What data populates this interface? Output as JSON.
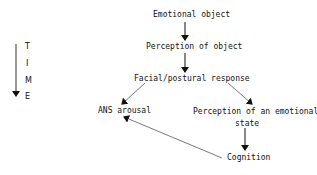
{
  "diagram": {
    "time_axis": {
      "letters": [
        "T",
        "I",
        "M",
        "E"
      ]
    },
    "nodes": [
      {
        "id": "emotional-object",
        "label": "Emotional object"
      },
      {
        "id": "perception-of-object",
        "label": "Perception of object"
      },
      {
        "id": "facial-postural-response",
        "label": "Facial/postural response"
      },
      {
        "id": "ans-arousal",
        "label": "ANS arousal"
      },
      {
        "id": "perception-emotional-state-1",
        "label": "Perception of an emotional"
      },
      {
        "id": "perception-emotional-state-2",
        "label": "state"
      },
      {
        "id": "cognition",
        "label": "Cognition"
      }
    ],
    "edges": [
      {
        "from": "Emotional object",
        "to": "Perception of object"
      },
      {
        "from": "Perception of object",
        "to": "Facial/postural response"
      },
      {
        "from": "Facial/postural response",
        "to": "ANS arousal"
      },
      {
        "from": "Facial/postural response",
        "to": "Perception of an emotional state"
      },
      {
        "from": "Perception of an emotional state",
        "to": "Cognition"
      },
      {
        "from": "Cognition",
        "to": "ANS arousal"
      }
    ]
  }
}
